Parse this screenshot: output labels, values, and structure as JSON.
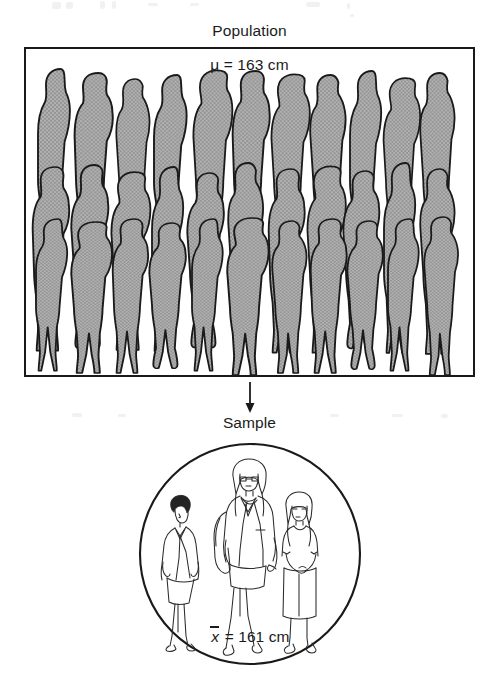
{
  "figure": {
    "type": "statistics-diagram",
    "population": {
      "title": "Population",
      "parameter_label": "μ = 163 cm",
      "parameter_symbol": "μ",
      "parameter_value": 163,
      "parameter_unit": "cm",
      "silhouette_rows": 3,
      "silhouettes_per_row": 12,
      "silhouette_total": 36,
      "silhouette_fill": "#a9a9a9",
      "silhouette_outline": "#1a1a1a",
      "box_border_color": "#1a1a1a",
      "box_background": "#ffffff"
    },
    "flow": {
      "arrow_direction": "down",
      "arrow_color": "#1a1a1a"
    },
    "sample": {
      "title": "Sample",
      "statistic_label_x": "x",
      "statistic_label_rest": " = 161 cm",
      "statistic_symbol": "x̄",
      "statistic_value": 161,
      "statistic_unit": "cm",
      "figure_count": 3,
      "figures": [
        "woman-dark-hair-blazer-skirt",
        "woman-walking-coat-glasses",
        "woman-long-hair-dress"
      ],
      "circle_color": "#1a1a1a",
      "circle_background": "#ffffff"
    }
  }
}
